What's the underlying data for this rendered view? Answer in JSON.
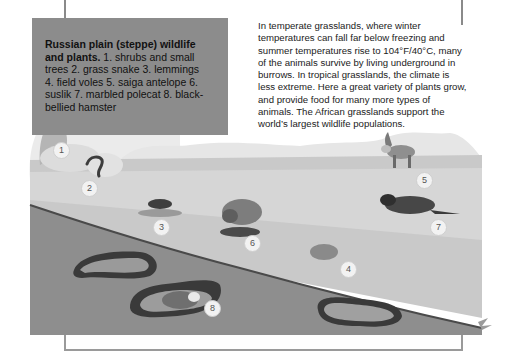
{
  "caption": {
    "title": "Russian plain (steppe) wildlife and plants.",
    "body": "1. shrubs and small trees 2. grass snake 3. lemmings 4. field voles 5. saiga antelope 6. suslik 7. marbled polecat 8. black-bellied hamster"
  },
  "description": "In temperate grasslands, where winter temperatures can fall far below freezing and summer temperatures rise to 104°F/40°C, many of the animals survive by living underground in burrows. In tropical grasslands, the climate is less extreme. Here a great variety of plants grow, and provide food for many more types of animals. The African grasslands support the world’s largest wildlife populations.",
  "markers": [
    {
      "n": "1",
      "label": "shrubs and small trees",
      "x": 53,
      "y": 142
    },
    {
      "n": "2",
      "label": "grass snake",
      "x": 81,
      "y": 180
    },
    {
      "n": "3",
      "label": "lemmings",
      "x": 153,
      "y": 219
    },
    {
      "n": "4",
      "label": "field voles",
      "x": 340,
      "y": 261
    },
    {
      "n": "5",
      "label": "saiga antelope",
      "x": 416,
      "y": 172
    },
    {
      "n": "6",
      "label": "suslik",
      "x": 244,
      "y": 235
    },
    {
      "n": "7",
      "label": "marbled polecat",
      "x": 430,
      "y": 219
    },
    {
      "n": "8",
      "label": "black-bellied hamster",
      "x": 204,
      "y": 300
    }
  ]
}
